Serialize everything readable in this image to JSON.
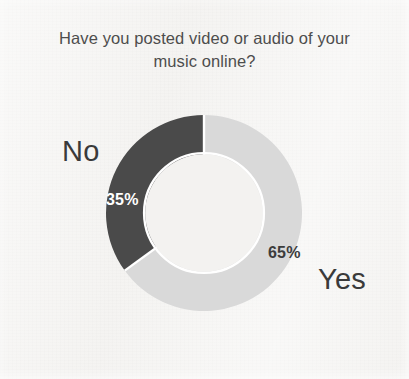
{
  "chart_data": {
    "type": "pie",
    "variant": "donut",
    "title": "Have you posted video or audio of your\nmusic online?",
    "xlabel": "",
    "ylabel": "",
    "legend": "none",
    "grid": false,
    "start_angle_deg": 0,
    "direction": "clockwise",
    "inner_radius_ratio": 0.6,
    "categories": [
      "Yes",
      "No"
    ],
    "values": [
      65,
      35
    ],
    "unit": "%",
    "slices": [
      {
        "label": "Yes",
        "value": 65,
        "value_text": "65%",
        "color": "#d9d9d9",
        "label_color": "#3a3a3a",
        "value_text_color": "#3c3c3c"
      },
      {
        "label": "No",
        "value": 35,
        "value_text": "35%",
        "color": "#4a4a4a",
        "label_color": "#3a3a3a",
        "value_text_color": "#ffffff"
      }
    ]
  },
  "chart": {
    "title": "Have you posted video or audio of your\nmusic online?",
    "background_color": "#f3f2f0",
    "separator_color": "#ffffff",
    "labels": {
      "no": "No",
      "yes": "Yes",
      "no_pct": "35%",
      "yes_pct": "65%"
    }
  }
}
